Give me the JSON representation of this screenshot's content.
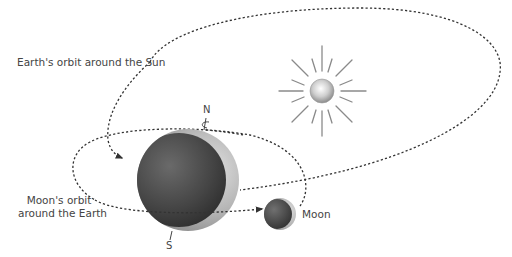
{
  "labels": {
    "earth_orbit": "Earth's orbit around the Sun",
    "moon_orbit_line1": "Moon's orbit",
    "moon_orbit_line2": "around the Earth",
    "moon": "Moon",
    "north": "N",
    "south": "S"
  },
  "bodies": {
    "sun": {
      "name": "Sun",
      "cx": 322,
      "cy": 91,
      "r": 12
    },
    "earth": {
      "name": "Earth",
      "cx": 188,
      "cy": 180,
      "r": 51
    },
    "moon": {
      "name": "Moon",
      "cx": 280,
      "cy": 214,
      "r": 16
    }
  },
  "colors": {
    "orbit_line": "#333333",
    "sun_rays": "#8a8a8a",
    "earth_dark": "#3a3a3a",
    "earth_light": "#bdbdbd",
    "label_text": "#444444"
  }
}
